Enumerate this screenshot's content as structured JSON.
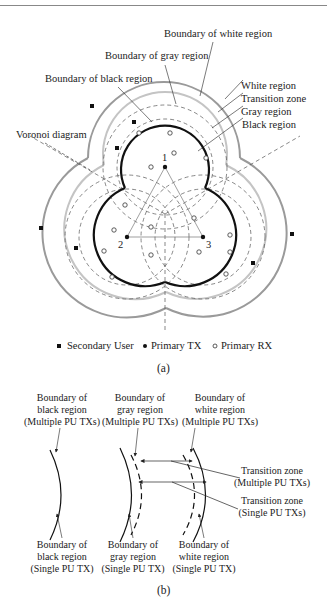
{
  "figure_a": {
    "labels": {
      "boundary_white": "Boundary of white region",
      "boundary_gray": "Boundary of gray region",
      "boundary_black": "Boundary of black region",
      "white_region": "White region",
      "transition_zone": "Transition zone",
      "gray_region": "Gray region",
      "black_region": "Black region",
      "voronoi": "Voronoi diagram"
    },
    "tx_labels": [
      "1",
      "2",
      "3"
    ],
    "legend": {
      "secondary_user": "Secondary User",
      "primary_tx": "Primary TX",
      "primary_rx": "Primary RX"
    },
    "caption": "(a)"
  },
  "figure_b": {
    "top_labels": [
      {
        "line1": "Boundary of",
        "line2": "black region",
        "line3": "(Multiple PU TXs)"
      },
      {
        "line1": "Boundary of",
        "line2": "gray region",
        "line3": "(Multiple PU TXs)"
      },
      {
        "line1": "Boundary of",
        "line2": "white region",
        "line3": "(Multiple PU TXs)"
      }
    ],
    "bottom_labels": [
      {
        "line1": "Boundary of",
        "line2": "black region",
        "line3": "(Single PU TX)"
      },
      {
        "line1": "Boundary of",
        "line2": "gray region",
        "line3": "(Single PU TX)"
      },
      {
        "line1": "Boundary of",
        "line2": "white region",
        "line3": "(Single PU TX)"
      }
    ],
    "right_labels": [
      {
        "line1": "Transition zone",
        "line2": "(Multiple PU TXs)"
      },
      {
        "line1": "Transition zone",
        "line2": "(Single PU TXs)"
      }
    ],
    "caption": "(b)"
  },
  "colors": {
    "black_boundary": "#111111",
    "gray_boundary": "#bbbbbb",
    "white_boundary": "#999999",
    "voronoi": "#555555"
  }
}
